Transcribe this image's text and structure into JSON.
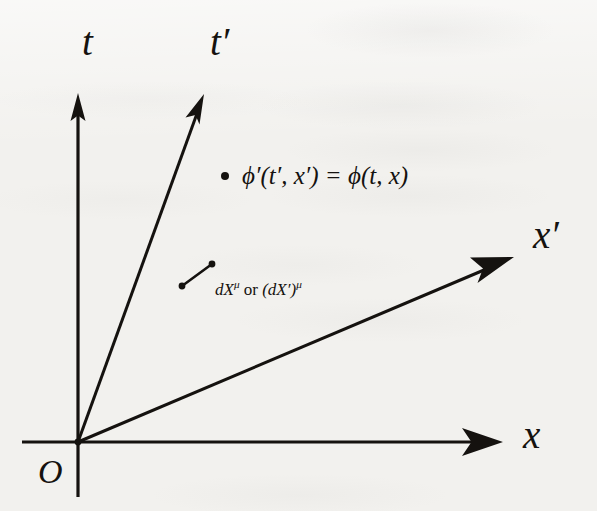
{
  "figure": {
    "kind": "spacetime-coordinate-diagram",
    "background_color": "#f2f1ee",
    "ink_color": "#15120f",
    "width": 597,
    "height": 511
  },
  "origin": {
    "label": "O",
    "x": 78,
    "y": 442
  },
  "axes": [
    {
      "name": "t-axis",
      "label": "t",
      "label_x": 82,
      "label_y": 22,
      "from": [
        78,
        442
      ],
      "to": [
        78,
        95
      ],
      "arrowhead": "narrow-triangle"
    },
    {
      "name": "t-prime-axis",
      "label": "t′",
      "label_x": 210,
      "label_y": 22,
      "from": [
        78,
        442
      ],
      "to": [
        203,
        97
      ],
      "arrowhead": "narrow-triangle"
    },
    {
      "name": "x-axis",
      "label": "x",
      "label_x": 523,
      "label_y": 415,
      "from": [
        78,
        442
      ],
      "to": [
        500,
        442
      ],
      "arrowhead": "barbed"
    },
    {
      "name": "x-prime-axis",
      "label": "x′",
      "label_x": 533,
      "label_y": 215,
      "from": [
        78,
        442
      ],
      "to": [
        512,
        258
      ],
      "arrowhead": "barbed"
    }
  ],
  "annotations": {
    "field_point": {
      "name": "field-equality",
      "dot_x": 225,
      "dot_y": 176,
      "text_x": 242,
      "text_y": 163,
      "phi_prime": "ϕ′",
      "primed_args": "(t′, x′)",
      "equals": " = ",
      "phi": "ϕ",
      "unprimed_args": "(t, x)",
      "full_text": "ϕ′(t′, x′) = ϕ(t, x)"
    },
    "displacement": {
      "name": "displacement-vector",
      "segment_from": [
        182,
        286
      ],
      "segment_to": [
        212,
        264
      ],
      "text_x": 215,
      "text_y": 281,
      "unprimed": "dX",
      "unprimed_index": "μ",
      "conjunction": " or ",
      "primed": "(dX′)",
      "primed_index": "μ",
      "full_text": "dXμ or (dX′)μ"
    }
  }
}
